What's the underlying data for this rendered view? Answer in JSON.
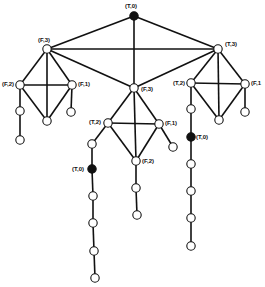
{
  "diagram": {
    "type": "graph",
    "title": "",
    "colors": {
      "edge": "#111111",
      "node_fill_open": "#ffffff",
      "node_fill_filled": "#111111",
      "background": "#ffffff"
    },
    "nodes": [
      {
        "id": "root",
        "x": 134,
        "y": 16,
        "filled": true,
        "label": "(T,0)",
        "lx": 125,
        "ly": 3
      },
      {
        "id": "L",
        "x": 47,
        "y": 49,
        "filled": false,
        "label": "(F,3)",
        "lx": 38,
        "ly": 37
      },
      {
        "id": "R",
        "x": 218,
        "y": 49,
        "filled": false,
        "label": "(T,3)",
        "lx": 225,
        "ly": 41
      },
      {
        "id": "M",
        "x": 134,
        "y": 88,
        "filled": false,
        "label": "(F,3)",
        "lx": 141,
        "ly": 86
      },
      {
        "id": "L2",
        "x": 20,
        "y": 85,
        "filled": false,
        "label": "(F,2)",
        "lx": 2,
        "ly": 81
      },
      {
        "id": "L1",
        "x": 72,
        "y": 85,
        "filled": false,
        "label": "(F,1)",
        "lx": 78,
        "ly": 81
      },
      {
        "id": "LB",
        "x": 47,
        "y": 121,
        "filled": false,
        "label": ""
      },
      {
        "id": "L1c",
        "x": 71,
        "y": 112,
        "filled": false,
        "label": ""
      },
      {
        "id": "L2c1",
        "x": 20,
        "y": 111,
        "filled": false,
        "label": ""
      },
      {
        "id": "L2c2",
        "x": 20,
        "y": 140,
        "filled": false,
        "label": ""
      },
      {
        "id": "R2",
        "x": 191,
        "y": 83,
        "filled": false,
        "label": "(T,2)",
        "lx": 173,
        "ly": 80
      },
      {
        "id": "R1",
        "x": 245,
        "y": 84,
        "filled": false,
        "label": "(F,1",
        "lx": 251,
        "ly": 80
      },
      {
        "id": "RB",
        "x": 219,
        "y": 120,
        "filled": false,
        "label": ""
      },
      {
        "id": "R1c",
        "x": 245,
        "y": 112,
        "filled": false,
        "label": ""
      },
      {
        "id": "R2c1",
        "x": 191,
        "y": 109,
        "filled": false,
        "label": ""
      },
      {
        "id": "R2f",
        "x": 191,
        "y": 137,
        "filled": true,
        "label": "(T,0)",
        "lx": 196,
        "ly": 134
      },
      {
        "id": "R2c3",
        "x": 191,
        "y": 164,
        "filled": false,
        "label": ""
      },
      {
        "id": "R2c4",
        "x": 191,
        "y": 191,
        "filled": false,
        "label": ""
      },
      {
        "id": "R2c5",
        "x": 191,
        "y": 218,
        "filled": false,
        "label": ""
      },
      {
        "id": "R2c6",
        "x": 191,
        "y": 246,
        "filled": false,
        "label": ""
      },
      {
        "id": "M2",
        "x": 108,
        "y": 123,
        "filled": false,
        "label": "(T,2)",
        "lx": 89,
        "ly": 119
      },
      {
        "id": "M1",
        "x": 159,
        "y": 124,
        "filled": false,
        "label": "(F,1)",
        "lx": 165,
        "ly": 120
      },
      {
        "id": "MB",
        "x": 136,
        "y": 161,
        "filled": false,
        "label": "(F,2)",
        "lx": 142,
        "ly": 158
      },
      {
        "id": "M1c",
        "x": 173,
        "y": 147,
        "filled": false,
        "label": ""
      },
      {
        "id": "M2c1",
        "x": 92,
        "y": 144,
        "filled": false,
        "label": ""
      },
      {
        "id": "M2f",
        "x": 92,
        "y": 169,
        "filled": true,
        "label": "(T,0)",
        "lx": 72,
        "ly": 166
      },
      {
        "id": "M2c3",
        "x": 93,
        "y": 196,
        "filled": false,
        "label": ""
      },
      {
        "id": "M2c4",
        "x": 93,
        "y": 223,
        "filled": false,
        "label": ""
      },
      {
        "id": "M2c5",
        "x": 94,
        "y": 251,
        "filled": false,
        "label": ""
      },
      {
        "id": "M2c6",
        "x": 95,
        "y": 278,
        "filled": false,
        "label": ""
      },
      {
        "id": "MBc1",
        "x": 136,
        "y": 188,
        "filled": false,
        "label": ""
      },
      {
        "id": "MBc2",
        "x": 137,
        "y": 215,
        "filled": false,
        "label": ""
      }
    ],
    "edges": [
      [
        "root",
        "L"
      ],
      [
        "root",
        "R"
      ],
      [
        "root",
        "M"
      ],
      [
        "L",
        "R"
      ],
      [
        "L",
        "M"
      ],
      [
        "R",
        "M"
      ],
      [
        "L",
        "L2"
      ],
      [
        "L",
        "L1"
      ],
      [
        "L",
        "LB"
      ],
      [
        "L2",
        "L1"
      ],
      [
        "L2",
        "LB"
      ],
      [
        "L1",
        "LB"
      ],
      [
        "L1",
        "L1c"
      ],
      [
        "L2",
        "L2c1"
      ],
      [
        "L2c1",
        "L2c2"
      ],
      [
        "R",
        "R2"
      ],
      [
        "R",
        "R1"
      ],
      [
        "R",
        "RB"
      ],
      [
        "R2",
        "R1"
      ],
      [
        "R2",
        "RB"
      ],
      [
        "R1",
        "RB"
      ],
      [
        "R1",
        "R1c"
      ],
      [
        "R2",
        "R2c1"
      ],
      [
        "R2c1",
        "R2f"
      ],
      [
        "R2f",
        "R2c3"
      ],
      [
        "R2c3",
        "R2c4"
      ],
      [
        "R2c4",
        "R2c5"
      ],
      [
        "R2c5",
        "R2c6"
      ],
      [
        "M",
        "M2"
      ],
      [
        "M",
        "M1"
      ],
      [
        "M",
        "MB"
      ],
      [
        "M2",
        "M1"
      ],
      [
        "M2",
        "MB"
      ],
      [
        "M1",
        "MB"
      ],
      [
        "M1",
        "M1c"
      ],
      [
        "M2",
        "M2c1"
      ],
      [
        "M2c1",
        "M2f"
      ],
      [
        "M2f",
        "M2c3"
      ],
      [
        "M2c3",
        "M2c4"
      ],
      [
        "M2c4",
        "M2c5"
      ],
      [
        "M2c5",
        "M2c6"
      ],
      [
        "MB",
        "MBc1"
      ],
      [
        "MBc1",
        "MBc2"
      ]
    ]
  }
}
